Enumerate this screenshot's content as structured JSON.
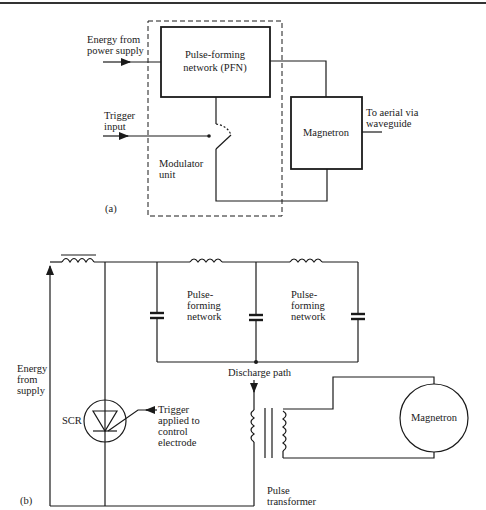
{
  "page": {
    "header_text": "·· ··· ··· ····· ····"
  },
  "diagram_a": {
    "label": "(a)",
    "energy_input": {
      "line1": "Energy from",
      "line2": "power supply"
    },
    "trigger_input": {
      "line1": "Trigger",
      "line2": "input"
    },
    "pfn_block": {
      "line1": "Pulse-forming",
      "line2": "network (PFN)"
    },
    "modulator": {
      "line1": "Modulator",
      "line2": "unit"
    },
    "magnetron_block": {
      "label": "Magnetron"
    },
    "output": {
      "line1": "To aerial via",
      "line2": "waveguide"
    }
  },
  "diagram_b": {
    "label": "(b)",
    "energy_supply": {
      "line1": "Energy",
      "line2": "from",
      "line3": "supply"
    },
    "pfn_left": {
      "line1": "Pulse-",
      "line2": "forming",
      "line3": "network"
    },
    "pfn_right": {
      "line1": "Pulse-",
      "line2": "forming",
      "line3": "network"
    },
    "discharge_path": "Discharge path",
    "scr": {
      "label": "SCR"
    },
    "trigger_note": {
      "line1": "Trigger",
      "line2": "applied to",
      "line3": "control",
      "line4": "electrode"
    },
    "pulse_transformer": {
      "line1": "Pulse",
      "line2": "transformer"
    },
    "magnetron": {
      "label": "Magnetron"
    }
  },
  "colors": {
    "ink": "#1a1a1a",
    "background": "#ffffff"
  }
}
